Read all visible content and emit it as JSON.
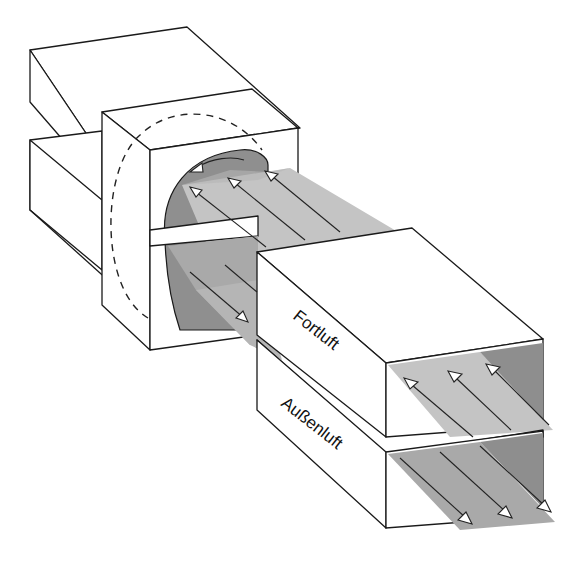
{
  "diagram": {
    "labels": {
      "exhaust": "Fortluft",
      "outdoor": "Außenluft"
    },
    "components": [
      {
        "id": "back-duct-upper",
        "description": "oberer Kanal (Rückseite)"
      },
      {
        "id": "back-duct-lower",
        "description": "unterer Kanal (Rückseite)"
      },
      {
        "id": "wheel-housing",
        "description": "Gehäuse mit rotierendem Rad"
      },
      {
        "id": "rotor",
        "description": "Rotor / Wärmerad (gestrichelter Umriss)"
      },
      {
        "id": "exhaust-duct",
        "description": "Fortluft-Kanal"
      },
      {
        "id": "outdoor-duct",
        "description": "Außenluft-Kanal"
      }
    ],
    "flows": {
      "upper_direction": "toward wheel (Fortluft out)",
      "lower_direction": "away from wheel (Außenluft in)",
      "upper_arrow_count": 3,
      "lower_arrow_count": 3,
      "rotation_arrow": "counter-clockwise"
    },
    "colors": {
      "line": "#1a1a1a",
      "face": "#ffffff",
      "flow_light": "#c4c4c4",
      "flow_mid": "#a9a9a9",
      "flow_dark": "#8e8e8e",
      "rotor_fill": "#8f8f8f"
    }
  }
}
